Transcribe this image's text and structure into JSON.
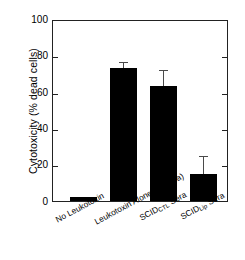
{
  "chart_data": {
    "type": "bar",
    "title": "",
    "xlabel": "",
    "ylabel": "Cytotoxicity (% dead cells)",
    "ylim": [
      0,
      100
    ],
    "yticks": [
      0,
      20,
      40,
      60,
      80,
      100
    ],
    "ytick_labels": [
      "0",
      "20",
      "40",
      "60",
      "80",
      "100"
    ],
    "grid": false,
    "legend": null,
    "bar_color": "#000000",
    "categories": [
      "No Leukotoxin",
      "Leukotoxin Alone (no sera)",
      "SCID CTL Sera",
      "SCID Lip Sera"
    ],
    "category_parts": [
      {
        "main": "No Leukotoxin",
        "sub": ""
      },
      {
        "main": "Leukotoxin Alone (no sera)",
        "sub": ""
      },
      {
        "main_before": "SCID",
        "sub": "CTL",
        "main_after": " Sera"
      },
      {
        "main_before": "SCID",
        "sub": "Lip",
        "main_after": " Sera"
      }
    ],
    "values": [
      2,
      74,
      64,
      15
    ],
    "errors": [
      0,
      3,
      9,
      10
    ]
  },
  "axis": {
    "y_title": "Cytotoxicity (% dead cells)",
    "tick_0": "0",
    "tick_20": "20",
    "tick_40": "40",
    "tick_60": "60",
    "tick_80": "80",
    "tick_100": "100"
  },
  "labels": {
    "bar1_main": "No Leukotoxin",
    "bar2_main": "Leukotoxin Alone (no sera)",
    "bar3_pre": "SCID",
    "bar3_sub": "CTL",
    "bar3_post": " Sera",
    "bar4_pre": "SCID",
    "bar4_sub": "Lip",
    "bar4_post": " Sera"
  }
}
